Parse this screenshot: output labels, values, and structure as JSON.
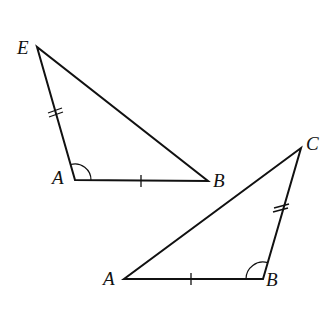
{
  "diagram": {
    "stroke_color": "#111111",
    "triangle_1": {
      "vertices": {
        "E": {
          "label": "E",
          "x": 37,
          "y": 47
        },
        "A": {
          "label": "A",
          "x": 75,
          "y": 180
        },
        "B": {
          "label": "B",
          "x": 208,
          "y": 181
        }
      },
      "marks": {
        "EA": "double tick",
        "AB": "single tick",
        "angle_A": "arc"
      }
    },
    "triangle_2": {
      "vertices": {
        "A": {
          "label": "A",
          "x": 124,
          "y": 279
        },
        "B": {
          "label": "B",
          "x": 263,
          "y": 279
        },
        "C": {
          "label": "C",
          "x": 301,
          "y": 148
        }
      },
      "marks": {
        "BC": "double tick",
        "AB": "single tick",
        "angle_B": "arc"
      }
    }
  },
  "labels": {
    "t1_E": "E",
    "t1_A": "A",
    "t1_B": "B",
    "t2_A": "A",
    "t2_B": "B",
    "t2_C": "C"
  }
}
